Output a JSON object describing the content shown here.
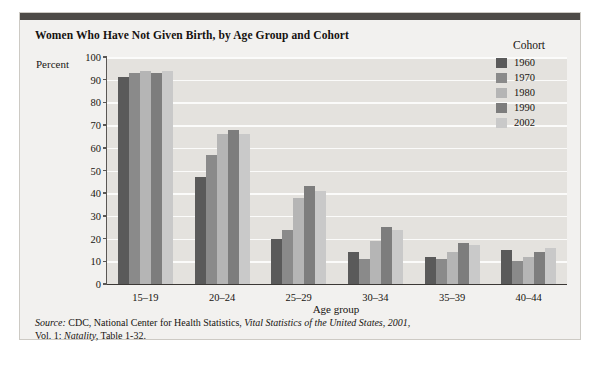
{
  "title": "Women Who Have Not Given Birth, by Age Group and Cohort",
  "axis": {
    "ylabel": "Percent",
    "xlabel": "Age group"
  },
  "legend": {
    "title": "Cohort",
    "entries": [
      {
        "label": "1960",
        "color": "#5a5a5a"
      },
      {
        "label": "1970",
        "color": "#8a8a8a"
      },
      {
        "label": "1980",
        "color": "#b5b5b5"
      },
      {
        "label": "1990",
        "color": "#7d7d7d"
      },
      {
        "label": "2002",
        "color": "#c9c9c9"
      }
    ]
  },
  "source": {
    "line1_prefix": "Source:",
    "line1_a": " CDC, National Center for Health Statistics, ",
    "line1_italic": "Vital Statistics of the United States, 2001,",
    "line2_a": "Vol. 1: ",
    "line2_italic": "Natality,",
    "line2_b": " Table 1-32."
  },
  "chart_data": {
    "type": "bar",
    "title": "Women Who Have Not Given Birth, by Age Group and Cohort",
    "xlabel": "Age group",
    "ylabel": "Percent",
    "ylim": [
      0,
      100
    ],
    "yticks": [
      0,
      10,
      20,
      30,
      40,
      50,
      60,
      70,
      80,
      90,
      100
    ],
    "grid": true,
    "legend_position": "right",
    "categories": [
      "15-19",
      "20-24",
      "25-29",
      "30-34",
      "35-39",
      "40-44"
    ],
    "series": [
      {
        "name": "1960",
        "color": "#5a5a5a",
        "values": [
          91,
          47,
          20,
          14,
          12,
          15
        ]
      },
      {
        "name": "1970",
        "color": "#8a8a8a",
        "values": [
          93,
          57,
          24,
          11,
          11,
          10
        ]
      },
      {
        "name": "1980",
        "color": "#b5b5b5",
        "values": [
          94,
          66,
          38,
          19,
          14,
          12
        ]
      },
      {
        "name": "1990",
        "color": "#7d7d7d",
        "values": [
          93,
          68,
          43,
          25,
          18,
          14
        ]
      },
      {
        "name": "2002",
        "color": "#c9c9c9",
        "values": [
          94,
          66,
          41,
          24,
          17,
          16
        ]
      }
    ]
  }
}
